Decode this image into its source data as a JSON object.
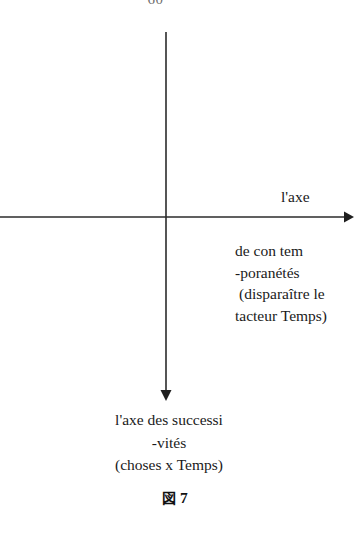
{
  "page": {
    "page_number": "60",
    "background_color": "#ffffff",
    "ink_color": "#1a1a1a"
  },
  "figure": {
    "caption_symbol": "図",
    "caption_number": "7",
    "caption_full": "図 7"
  },
  "axes": {
    "origin": {
      "x": 166,
      "y": 217
    },
    "horizontal": {
      "name": "horizontal-axis",
      "from_x": 0,
      "to_x": 349,
      "y": 217,
      "arrow_at": "right",
      "color": "#2b2b2b"
    },
    "vertical": {
      "name": "vertical-axis",
      "x": 166,
      "from_y": 32,
      "to_y": 400,
      "arrow_at": "bottom",
      "color": "#2b2b2b"
    }
  },
  "labels": {
    "x_axis_label": "l'axe",
    "x_axis_block": [
      "de con tem",
      "-poranétés",
      "(disparaître le",
      "tacteur Temps)"
    ],
    "y_axis_block": [
      "l'axe des successi",
      "-vités",
      "(choses x Temps)"
    ]
  }
}
